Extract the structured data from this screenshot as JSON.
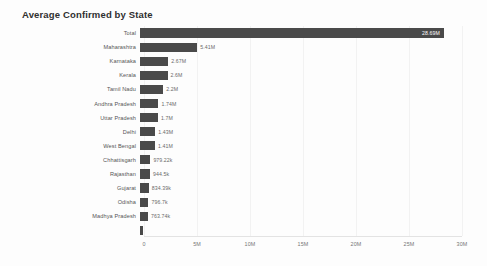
{
  "chart_data": {
    "type": "bar",
    "orientation": "horizontal",
    "title": "Average Confirmed by State",
    "xlabel": "",
    "ylabel": "",
    "xlim": [
      0,
      30000000
    ],
    "grid": true,
    "legend": false,
    "axis_ticks": [
      {
        "label": "0",
        "value": 0
      },
      {
        "label": "5M",
        "value": 5000000
      },
      {
        "label": "10M",
        "value": 10000000
      },
      {
        "label": "15M",
        "value": 15000000
      },
      {
        "label": "20M",
        "value": 20000000
      },
      {
        "label": "25M",
        "value": 25000000
      },
      {
        "label": "30M",
        "value": 30000000
      }
    ],
    "categories": [
      "Total",
      "Maharashtra",
      "Karnataka",
      "Kerala",
      "Tamil Nadu",
      "Andhra Pradesh",
      "Uttar Pradesh",
      "Delhi",
      "West Bengal",
      "Chhattisgarh",
      "Rajasthan",
      "Gujarat",
      "Odisha",
      "Madhya Pradesh",
      ""
    ],
    "values": [
      28690000,
      5410000,
      2670000,
      2600000,
      2200000,
      1740000,
      1700000,
      1430000,
      1410000,
      979220,
      944500,
      834390,
      796700,
      763740,
      300000
    ],
    "value_labels": [
      "28.69M",
      "5.41M",
      "2.67M",
      "2.6M",
      "2.2M",
      "1.74M",
      "1.7M",
      "1.43M",
      "1.41M",
      "979.22k",
      "944.5k",
      "834.39k",
      "796.7k",
      "763.74k",
      ""
    ],
    "bar_color": "#4a4a4a",
    "background_color": "#fdfdfd",
    "gridline_color": "#f2f2f2",
    "label_color": "#555555"
  }
}
